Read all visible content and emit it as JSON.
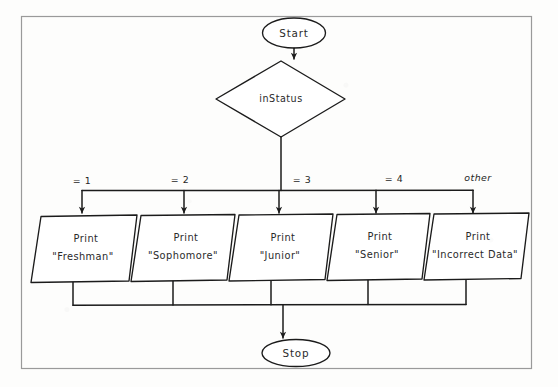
{
  "diagram": {
    "kind": "flowchart",
    "title_text": "",
    "border_color": "#9a9a9a",
    "stroke_color": "#1b1b1b",
    "fill_color": "#ffffff",
    "background_color": "#fdfdfc"
  },
  "nodes": {
    "start": {
      "label": "Start",
      "shape": "terminator-ellipse"
    },
    "decision": {
      "label": "inStatus",
      "shape": "diamond"
    },
    "stop": {
      "label": "Stop",
      "shape": "terminator-ellipse"
    }
  },
  "branches": [
    {
      "label": "= 1",
      "italic": false
    },
    {
      "label": "= 2",
      "italic": false
    },
    {
      "label": "= 3",
      "italic": false
    },
    {
      "label": "= 4",
      "italic": false
    },
    {
      "label": "other",
      "italic": true
    }
  ],
  "outputs": [
    {
      "line1": "Print",
      "line2": "\"Freshman\"",
      "shape": "parallelogram"
    },
    {
      "line1": "Print",
      "line2": "\"Sophomore\"",
      "shape": "parallelogram"
    },
    {
      "line1": "Print",
      "line2": "\"Junior\"",
      "shape": "parallelogram"
    },
    {
      "line1": "Print",
      "line2": "\"Senior\"",
      "shape": "parallelogram"
    },
    {
      "line1": "Print",
      "line2": "\"Incorrect Data\"",
      "shape": "parallelogram"
    }
  ]
}
